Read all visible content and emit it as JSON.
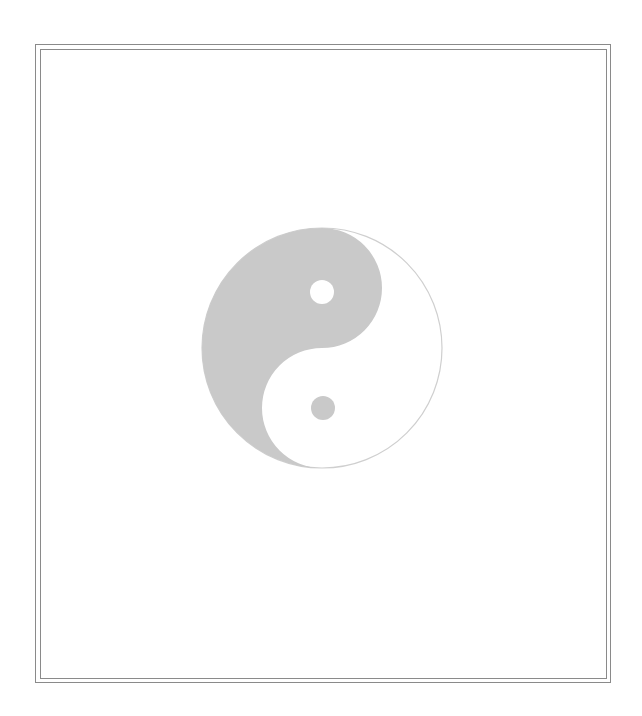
{
  "figure": {
    "colors": {
      "yin": "#c9c9c9",
      "yang": "#ffffff",
      "outline": "#cfcfcf",
      "frame": "#8a8a8a"
    },
    "circle": {
      "cx": 322,
      "cy": 348,
      "r": 120
    },
    "dots": [
      {
        "name": "yang-dot-in-yin",
        "cx": 322,
        "cy": 292,
        "r": 12,
        "color": "#ffffff"
      },
      {
        "name": "yin-dot-in-yang",
        "cx": 323,
        "cy": 408,
        "r": 12,
        "color": "#c9c9c9"
      }
    ]
  }
}
